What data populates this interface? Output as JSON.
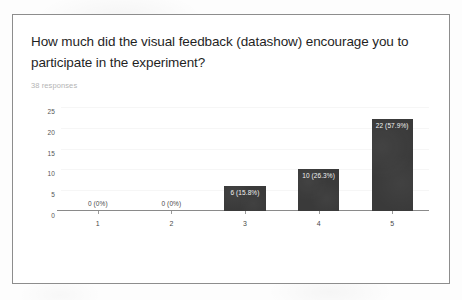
{
  "card": {
    "question_title": "How much did the visual feedback (datashow) encourage you to participate in the experiment?",
    "response_count": "38 responses"
  },
  "chart_data": {
    "type": "bar",
    "title": "How much did the visual feedback (datashow) encourage you to participate in the experiment?",
    "subtitle": "38 responses",
    "categories": [
      "1",
      "2",
      "3",
      "4",
      "5"
    ],
    "values": [
      0,
      0,
      6,
      10,
      22
    ],
    "percentages": [
      "0%",
      "0%",
      "15.8%",
      "26.3%",
      "57.9%"
    ],
    "data_labels": [
      "0 (0%)",
      "0 (0%)",
      "6 (15.8%)",
      "10 (26.3%)",
      "22 (57.9%)"
    ],
    "xlabel": "",
    "ylabel": "",
    "ylim": [
      0,
      25
    ],
    "yticks": [
      "0",
      "5",
      "10",
      "15",
      "20",
      "25"
    ],
    "grid": true,
    "legend": false,
    "bar_color": "#3a3a3a",
    "total_responses": 38
  }
}
